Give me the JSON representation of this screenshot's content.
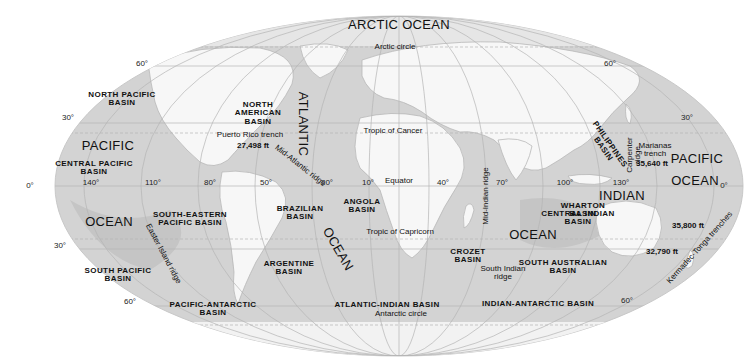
{
  "map": {
    "projection": "Mollweide",
    "colors": {
      "background": "#ffffff",
      "land": "#f7f7f7",
      "shelf": "#e4e4e4",
      "ocean": "#d3d3d3",
      "deep": "#bdbdbd",
      "grid": "#b5b5b5",
      "text": "#111111"
    },
    "oceans": [
      {
        "id": "arctic",
        "label": "ARCTIC OCEAN",
        "x": 399,
        "y": 25
      },
      {
        "id": "pacific-nw",
        "label": "PACIFIC",
        "x": 108,
        "y": 146
      },
      {
        "id": "pacific-sw",
        "label": "OCEAN",
        "x": 109,
        "y": 222
      },
      {
        "id": "atlantic-n",
        "label": "ATLANTIC",
        "x": 303,
        "y": 124,
        "rotate": 90
      },
      {
        "id": "atlantic-s",
        "label": "OCEAN",
        "x": 338,
        "y": 249,
        "rotate": 60
      },
      {
        "id": "indian-n",
        "label": "INDIAN",
        "x": 622,
        "y": 196
      },
      {
        "id": "indian-s",
        "label": "OCEAN",
        "x": 533,
        "y": 235
      },
      {
        "id": "pacific-ne",
        "label": "PACIFIC",
        "x": 697,
        "y": 159
      },
      {
        "id": "pacific-se",
        "label": "OCEAN",
        "x": 695,
        "y": 181
      }
    ],
    "basins": [
      {
        "id": "north-pacific",
        "label": "NORTH PACIFIC\nBASIN",
        "x": 122,
        "y": 99
      },
      {
        "id": "central-pacific",
        "label": "CENTRAL PACIFIC\nBASIN",
        "x": 94,
        "y": 168
      },
      {
        "id": "north-american",
        "label": "NORTH\nAMERICAN\nBASIN",
        "x": 258,
        "y": 114
      },
      {
        "id": "south-eastern-pacific",
        "label": "SOUTH-EASTERN\nPACIFIC BASIN",
        "x": 190,
        "y": 219
      },
      {
        "id": "brazilian",
        "label": "BRAZILIAN\nBASIN",
        "x": 300,
        "y": 213
      },
      {
        "id": "angola",
        "label": "ANGOLA\nBASIN",
        "x": 362,
        "y": 206
      },
      {
        "id": "argentine",
        "label": "ARGENTINE\nBASIN",
        "x": 289,
        "y": 268
      },
      {
        "id": "south-pacific",
        "label": "SOUTH PACIFIC\nBASIN",
        "x": 118,
        "y": 275
      },
      {
        "id": "pacific-antarctic",
        "label": "PACIFIC-ANTARCTIC\nBASIN",
        "x": 213,
        "y": 309
      },
      {
        "id": "atlantic-indian",
        "label": "ATLANTIC-INDIAN BASIN",
        "x": 387,
        "y": 305
      },
      {
        "id": "crozet",
        "label": "CROZET\nBASIN",
        "x": 468,
        "y": 256
      },
      {
        "id": "central-indian",
        "label": "CENTRAL INDIAN\nBASIN",
        "x": 578,
        "y": 218
      },
      {
        "id": "wharton",
        "label": "WHARTON\nBASIN",
        "x": 583,
        "y": 210
      },
      {
        "id": "south-australian",
        "label": "SOUTH AUSTRALIAN\nBASIN",
        "x": 563,
        "y": 267
      },
      {
        "id": "indian-antarctic",
        "label": "INDIAN-ANTARCTIC BASIN",
        "x": 538,
        "y": 304
      },
      {
        "id": "philippines",
        "label": "PHILIPPINES\nBASIN",
        "x": 606,
        "y": 147,
        "rotate": 55
      }
    ],
    "features": [
      {
        "id": "arctic-circle",
        "label": "Arctic circle",
        "x": 395,
        "y": 47
      },
      {
        "id": "tropic-cancer",
        "label": "Tropic of Cancer",
        "x": 393,
        "y": 131
      },
      {
        "id": "equator",
        "label": "Equator",
        "x": 399,
        "y": 181
      },
      {
        "id": "tropic-capricorn",
        "label": "Tropic of Capricorn",
        "x": 400,
        "y": 232
      },
      {
        "id": "antarctic-circle",
        "label": "Antarctic circle",
        "x": 401,
        "y": 314
      },
      {
        "id": "puerto-rico-trench",
        "label": "Puerto Rico trench",
        "x": 250,
        "y": 135
      },
      {
        "id": "marianas-trench",
        "label": "Marianas\ntrench",
        "x": 655,
        "y": 150
      },
      {
        "id": "south-indian-ridge",
        "label": "South Indian\nridge",
        "x": 503,
        "y": 273
      }
    ],
    "ridges": [
      {
        "id": "mid-atlantic",
        "label": "Mid-Atlantic ridge",
        "x": 300,
        "y": 166,
        "rotate": 38
      },
      {
        "id": "easter-island",
        "label": "Easter Island ridge",
        "x": 163,
        "y": 254,
        "rotate": 62
      },
      {
        "id": "mid-indian",
        "label": "Mid-Indian ridge",
        "x": 486,
        "y": 196,
        "rotate": -90
      },
      {
        "id": "carpenter",
        "label": "Carpenter\nridge",
        "x": 634,
        "y": 155,
        "rotate": -90
      },
      {
        "id": "kermadec-tonga",
        "label": "Kermadec-Tonga trenches",
        "x": 700,
        "y": 248,
        "rotate": -48
      }
    ],
    "depths": [
      {
        "id": "puerto-rico-depth",
        "label": "27,498 ft",
        "x": 253,
        "y": 146
      },
      {
        "id": "marianas-depth",
        "label": "35,640 ft",
        "x": 652,
        "y": 164
      },
      {
        "id": "kermadec-depth-1",
        "label": "35,800 ft",
        "x": 688,
        "y": 226
      },
      {
        "id": "kermadec-depth-2",
        "label": "32,790 ft",
        "x": 662,
        "y": 252
      }
    ],
    "degree_labels": [
      {
        "label": "60°",
        "x": 142,
        "y": 64
      },
      {
        "label": "30°",
        "x": 68,
        "y": 118
      },
      {
        "label": "0°",
        "x": 30,
        "y": 186
      },
      {
        "label": "140°",
        "x": 91,
        "y": 183
      },
      {
        "label": "110°",
        "x": 153,
        "y": 183
      },
      {
        "label": "80°",
        "x": 210,
        "y": 183
      },
      {
        "label": "50°",
        "x": 266,
        "y": 183
      },
      {
        "label": "20°",
        "x": 327,
        "y": 183
      },
      {
        "label": "10°",
        "x": 368,
        "y": 183
      },
      {
        "label": "40°",
        "x": 443,
        "y": 183
      },
      {
        "label": "70°",
        "x": 502,
        "y": 183
      },
      {
        "label": "100°",
        "x": 565,
        "y": 183
      },
      {
        "label": "130°",
        "x": 621,
        "y": 183
      },
      {
        "label": "0°",
        "x": 724,
        "y": 186
      },
      {
        "label": "30°",
        "x": 60,
        "y": 246
      },
      {
        "label": "60°",
        "x": 130,
        "y": 302
      },
      {
        "label": "60°",
        "x": 610,
        "y": 64
      },
      {
        "label": "30°",
        "x": 687,
        "y": 118
      },
      {
        "label": "60°",
        "x": 627,
        "y": 301
      }
    ],
    "graticule": {
      "latitudes_deg": [
        60,
        30,
        0,
        -30,
        -60
      ],
      "longitude_lines": 24
    }
  }
}
